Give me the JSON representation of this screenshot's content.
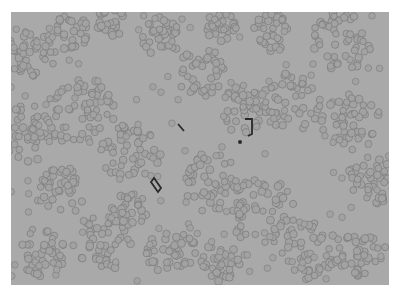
{
  "image": {
    "subject": "microscope view of clustered round cells",
    "background_color": "#a9a9a9",
    "cell_fill": "#a2a2a2",
    "cell_edge": "#7a7a7a",
    "debris_color": "#2a2a2a"
  }
}
